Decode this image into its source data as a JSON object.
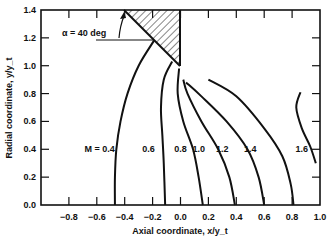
{
  "chart_data": {
    "type": "line",
    "title": "",
    "xlabel": "Axial coordinate,  x/y_t",
    "ylabel": "Radial coordinate,  y/y_t",
    "xlim": [
      -1.0,
      1.0
    ],
    "ylim": [
      0.0,
      1.4
    ],
    "grid": false,
    "x_ticks": [
      "-0.8",
      "-0.6",
      "-0.4",
      "-0.2",
      "0.0",
      "0.2",
      "0.4",
      "0.6",
      "0.8",
      "1.0"
    ],
    "y_ticks": [
      "0.0",
      "0.2",
      "0.4",
      "0.6",
      "0.8",
      "1.0",
      "1.2",
      "1.4"
    ],
    "annotation": "α = 40 deg",
    "cone": {
      "half_angle_deg": 40,
      "tip": [
        0.0,
        1.0
      ],
      "top": [
        -0.4,
        1.4
      ]
    },
    "series": [
      {
        "name": "M = 0.4",
        "label": "M = 0.4",
        "points": [
          [
            -0.19,
            1.18
          ],
          [
            -0.3,
            1.0
          ],
          [
            -0.38,
            0.8
          ],
          [
            -0.43,
            0.6
          ],
          [
            -0.46,
            0.4
          ],
          [
            -0.47,
            0.2
          ],
          [
            -0.47,
            0.0
          ]
        ]
      },
      {
        "name": "M = 0.6",
        "label": "0.6",
        "points": [
          [
            -0.06,
            1.03
          ],
          [
            -0.12,
            0.9
          ],
          [
            -0.14,
            0.7
          ],
          [
            -0.13,
            0.5
          ],
          [
            -0.12,
            0.3
          ],
          [
            -0.11,
            0.0
          ]
        ]
      },
      {
        "name": "M = 0.8",
        "label": "0.8",
        "points": [
          [
            -0.01,
            0.98
          ],
          [
            -0.02,
            0.8
          ],
          [
            0.02,
            0.6
          ],
          [
            0.09,
            0.4
          ],
          [
            0.13,
            0.2
          ],
          [
            0.16,
            0.0
          ]
        ]
      },
      {
        "name": "M = 1.0",
        "label": "1.0",
        "points": [
          [
            0.02,
            0.9
          ],
          [
            0.05,
            0.8
          ],
          [
            0.15,
            0.6
          ],
          [
            0.27,
            0.4
          ],
          [
            0.35,
            0.2
          ],
          [
            0.39,
            0.0
          ]
        ]
      },
      {
        "name": "M = 1.2",
        "label": "1.2",
        "points": [
          [
            0.04,
            0.88
          ],
          [
            0.15,
            0.78
          ],
          [
            0.33,
            0.6
          ],
          [
            0.48,
            0.4
          ],
          [
            0.56,
            0.2
          ],
          [
            0.6,
            0.0
          ]
        ]
      },
      {
        "name": "M = 1.4",
        "label": "1.4",
        "points": [
          [
            0.2,
            0.9
          ],
          [
            0.4,
            0.78
          ],
          [
            0.6,
            0.55
          ],
          [
            0.73,
            0.35
          ],
          [
            0.79,
            0.15
          ],
          [
            0.81,
            0.0
          ]
        ]
      },
      {
        "name": "M = 1.6",
        "label": "1.6",
        "points": [
          [
            0.86,
            0.81
          ],
          [
            0.83,
            0.7
          ],
          [
            0.87,
            0.55
          ],
          [
            0.93,
            0.42
          ],
          [
            0.97,
            0.3
          ]
        ]
      }
    ]
  }
}
